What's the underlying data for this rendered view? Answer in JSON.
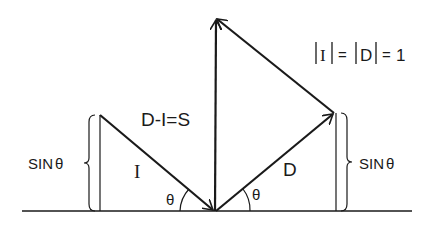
{
  "diagram": {
    "labels": {
      "equation": "D-I=S",
      "incident": "I",
      "diffracted": "D",
      "sin_left": "SIN",
      "sin_right": "SIN",
      "theta": "θ",
      "norm_I": "I",
      "norm_D": "D",
      "equals": "=",
      "one": "1"
    },
    "colors": {
      "stroke": "#1a1a1a",
      "background": "#ffffff"
    }
  }
}
